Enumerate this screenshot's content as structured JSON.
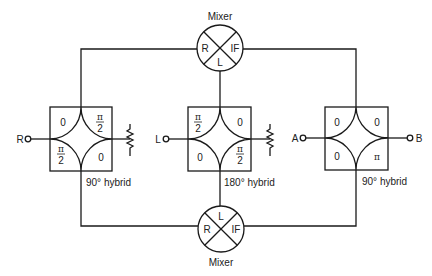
{
  "diagram": {
    "type": "image-reject mixer block diagram",
    "mixers": {
      "top": {
        "title": "Mixer",
        "ports": {
          "left": "R",
          "right": "IF",
          "bottom": "L"
        }
      },
      "bottom": {
        "title": "Mixer",
        "ports": {
          "left": "R",
          "right": "IF",
          "top": "L"
        }
      }
    },
    "hybrids": {
      "left": {
        "caption": "90° hybrid",
        "input_label": "R",
        "phases": {
          "tl": "0",
          "tr": "π/2",
          "bl": "π/2",
          "br": "0"
        },
        "termination": "resistor"
      },
      "middle": {
        "caption": "180° hybrid",
        "input_label": "L",
        "phases": {
          "tl": "π/2",
          "tr": "0",
          "bl": "0",
          "br": "π/2"
        },
        "termination": "resistor"
      },
      "right": {
        "caption": "90° hybrid",
        "input_label": "A",
        "output_label": "B",
        "phases": {
          "tl": "0",
          "tr": "0",
          "bl": "0",
          "br": "π"
        }
      }
    },
    "symbols": {
      "pi": "π",
      "two": "2",
      "zero": "0"
    }
  }
}
